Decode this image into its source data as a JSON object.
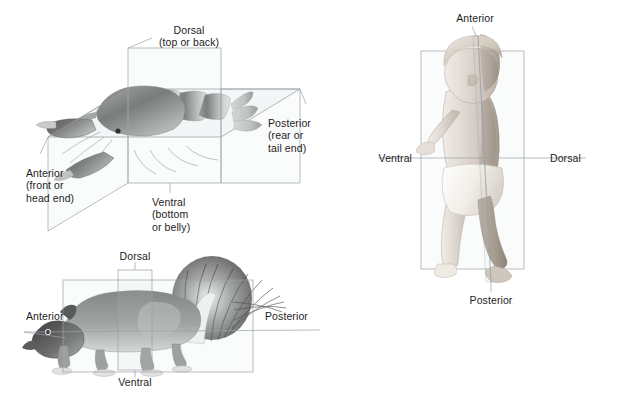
{
  "figure": {
    "background_color": "#ffffff",
    "text_color": "#1d1d1d",
    "plane_stroke_color": "#9aa2aa",
    "plane_fill_color": "#cdd4da"
  },
  "panels": {
    "lobster": {
      "subject": "lobster",
      "labels": {
        "dorsal": "Dorsal\n(top or back)",
        "anterior": "Anterior\n(front or\nhead end)",
        "posterior": "Posterior\n(rear or\ntail end)",
        "ventral": "Ventral\n(bottom\nor belly)"
      }
    },
    "squirrel": {
      "subject": "squirrel",
      "labels": {
        "dorsal": "Dorsal",
        "anterior": "Anterior",
        "posterior": "Posterior",
        "ventral": "Ventral"
      }
    },
    "human": {
      "subject": "human infant",
      "labels": {
        "anterior": "Anterior",
        "ventral": "Ventral",
        "dorsal": "Dorsal",
        "posterior": "Posterior"
      }
    }
  }
}
